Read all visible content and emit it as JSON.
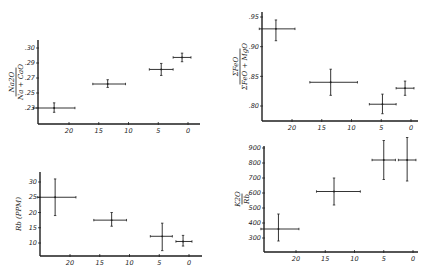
{
  "chart_data": [
    {
      "id": "na2o-ratio",
      "type": "scatter",
      "title": "",
      "ylabel": {
        "numerator": "Na2O",
        "denominator": "Na + CaO"
      },
      "xlabel": "",
      "x_ticks": [
        "20",
        "15",
        "10",
        "5",
        "0"
      ],
      "y_ticks": [
        ".30",
        ".29",
        ".27",
        ".25",
        ".23"
      ],
      "xlim": [
        25,
        -2
      ],
      "ylim": [
        0.22,
        0.31
      ],
      "grid": false,
      "frame": {
        "left": 38,
        "top": 40,
        "right": 200,
        "bottom": 124
      },
      "x_px": {
        "20": 69,
        "0": 188
      },
      "y_px": {
        "top_val": 0.3,
        "top_px": 48,
        "bot_val": 0.23,
        "bot_px": 108
      },
      "points": [
        {
          "x": 22.5,
          "y": 0.23,
          "xerr": [
            26,
            19
          ],
          "yerr": [
            0.225,
            0.236
          ]
        },
        {
          "x": 13.5,
          "y": 0.258,
          "xerr": [
            16,
            10.5
          ],
          "yerr": [
            0.254,
            0.263
          ]
        },
        {
          "x": 4.5,
          "y": 0.275,
          "xerr": [
            6.5,
            2.5
          ],
          "yerr": [
            0.268,
            0.282
          ]
        },
        {
          "x": 1.0,
          "y": 0.289,
          "xerr": [
            2.5,
            -0.5
          ],
          "yerr": [
            0.284,
            0.294
          ]
        }
      ]
    },
    {
      "id": "feo-ratio",
      "type": "scatter",
      "title": "",
      "ylabel": {
        "numerator": "ΣFeO",
        "denominator": "ΣFeO + MgO"
      },
      "xlabel": "",
      "x_ticks": [
        "20",
        "15",
        "10",
        "5",
        "0"
      ],
      "y_ticks": [
        ".95",
        ".90",
        ".85",
        ".80"
      ],
      "xlim": [
        25,
        -2
      ],
      "ylim": [
        0.78,
        0.96
      ],
      "grid": false,
      "frame": {
        "left": 262,
        "top": 12,
        "right": 418,
        "bottom": 121
      },
      "x_px": {
        "20": 292,
        "0": 411
      },
      "y_px": {
        "top_val": 0.95,
        "top_px": 17,
        "bot_val": 0.8,
        "bot_px": 106
      },
      "points": [
        {
          "x": 22.7,
          "y": 0.93,
          "xerr": [
            25.5,
            19.5
          ],
          "yerr": [
            0.91,
            0.945
          ]
        },
        {
          "x": 13.5,
          "y": 0.84,
          "xerr": [
            17,
            9
          ],
          "yerr": [
            0.818,
            0.862
          ]
        },
        {
          "x": 4.8,
          "y": 0.803,
          "xerr": [
            7,
            2.5
          ],
          "yerr": [
            0.787,
            0.82
          ]
        },
        {
          "x": 1.0,
          "y": 0.83,
          "xerr": [
            2.5,
            -0.5
          ],
          "yerr": [
            0.818,
            0.842
          ]
        }
      ]
    },
    {
      "id": "rb-ppm",
      "type": "scatter",
      "title": "",
      "ylabel": {
        "text": "Rb (PPM)"
      },
      "xlabel": "",
      "x_ticks": [
        "20",
        "15",
        "10",
        "5",
        "0"
      ],
      "y_ticks": [
        "30",
        "25",
        "20",
        "15",
        "10"
      ],
      "xlim": [
        25,
        -2
      ],
      "ylim": [
        5,
        33
      ],
      "grid": false,
      "frame": {
        "left": 40,
        "top": 172,
        "right": 202,
        "bottom": 256
      },
      "x_px": {
        "20": 70,
        "0": 189
      },
      "y_px": {
        "top_val": 30,
        "top_px": 182,
        "bot_val": 10,
        "bot_px": 243
      },
      "points": [
        {
          "x": 22.5,
          "y": 25.0,
          "xerr": [
            25.5,
            19
          ],
          "yerr": [
            19,
            31
          ]
        },
        {
          "x": 13.0,
          "y": 17.5,
          "xerr": [
            16,
            10.5
          ],
          "yerr": [
            15.5,
            20
          ]
        },
        {
          "x": 4.5,
          "y": 12.2,
          "xerr": [
            6.5,
            2.8
          ],
          "yerr": [
            7.5,
            16.5
          ]
        },
        {
          "x": 1.0,
          "y": 10.5,
          "xerr": [
            2.2,
            -0.5
          ],
          "yerr": [
            9,
            12.5
          ]
        }
      ]
    },
    {
      "id": "k2o-rb",
      "type": "scatter",
      "title": "",
      "ylabel": {
        "numerator": "K2O",
        "denominator": "Rb"
      },
      "xlabel": "",
      "x_ticks": [
        "20",
        "15",
        "10",
        "5",
        "0"
      ],
      "y_ticks": [
        "900",
        "800",
        "700",
        "600",
        "500",
        "400",
        "300"
      ],
      "xlim": [
        25,
        -2
      ],
      "ylim": [
        200,
        960
      ],
      "grid": false,
      "frame": {
        "left": 264,
        "top": 146,
        "right": 418,
        "bottom": 252
      },
      "x_px": {
        "20": 296,
        "0": 413
      },
      "y_px": {
        "top_val": 900,
        "top_px": 148,
        "bot_val": 300,
        "bot_px": 238
      },
      "points": [
        {
          "x": 23.0,
          "y": 360,
          "xerr": [
            26,
            19.5
          ],
          "yerr": [
            280,
            460
          ]
        },
        {
          "x": 13.5,
          "y": 610,
          "xerr": [
            16.5,
            9
          ],
          "yerr": [
            520,
            700
          ]
        },
        {
          "x": 5.0,
          "y": 820,
          "xerr": [
            7,
            3
          ],
          "yerr": [
            690,
            950
          ]
        },
        {
          "x": 1.0,
          "y": 820,
          "xerr": [
            2.5,
            -0.5
          ],
          "yerr": [
            680,
            970
          ]
        }
      ]
    }
  ]
}
